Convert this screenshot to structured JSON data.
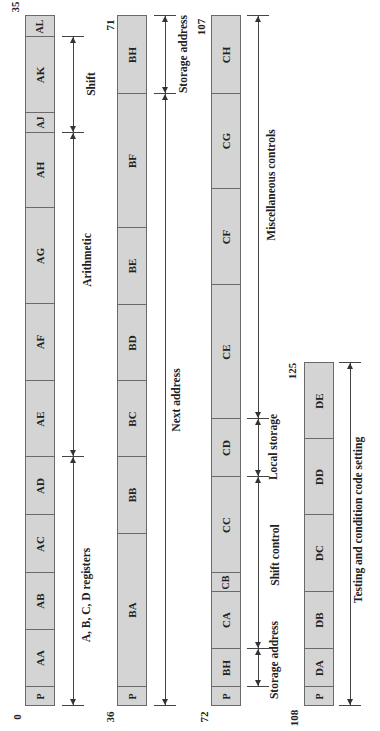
{
  "words": [
    {
      "start_bit": "0",
      "end_bit": "35",
      "fields": [
        {
          "label": "P",
          "top": 686,
          "bottom": 705
        },
        {
          "label": "AA",
          "top": 629,
          "bottom": 686
        },
        {
          "label": "AB",
          "top": 572,
          "bottom": 629
        },
        {
          "label": "AC",
          "top": 514,
          "bottom": 572
        },
        {
          "label": "AD",
          "top": 456,
          "bottom": 514
        },
        {
          "label": "AE",
          "top": 380,
          "bottom": 456
        },
        {
          "label": "AF",
          "top": 303,
          "bottom": 380
        },
        {
          "label": "AG",
          "top": 207,
          "bottom": 303
        },
        {
          "label": "AH",
          "top": 132,
          "bottom": 207
        },
        {
          "label": "AJ",
          "top": 112,
          "bottom": 132
        },
        {
          "label": "AK",
          "top": 36,
          "bottom": 112
        },
        {
          "label": "AL",
          "top": 15,
          "bottom": 36
        }
      ],
      "dimensions": [
        {
          "label": "A, B, C, D registers",
          "top": 456,
          "bottom": 705
        },
        {
          "label": "Arithmetic",
          "top": 132,
          "bottom": 456
        },
        {
          "label": "Shift",
          "top": 36,
          "bottom": 132
        }
      ]
    },
    {
      "start_bit": "36",
      "end_bit": "71",
      "fields": [
        {
          "label": "P",
          "top": 686,
          "bottom": 705
        },
        {
          "label": "BA",
          "top": 533,
          "bottom": 686
        },
        {
          "label": "BB",
          "top": 456,
          "bottom": 533
        },
        {
          "label": "BC",
          "top": 380,
          "bottom": 456
        },
        {
          "label": "BD",
          "top": 304,
          "bottom": 380
        },
        {
          "label": "BE",
          "top": 227,
          "bottom": 304
        },
        {
          "label": "BF",
          "top": 93,
          "bottom": 227
        },
        {
          "label": "BH",
          "top": 15,
          "bottom": 93
        }
      ],
      "dimensions": [
        {
          "label": "Next address",
          "top": 93,
          "bottom": 705
        },
        {
          "label": "Storage address",
          "top": 15,
          "bottom": 93
        }
      ]
    },
    {
      "start_bit": "72",
      "end_bit": "107",
      "fields": [
        {
          "label": "P",
          "top": 686,
          "bottom": 705
        },
        {
          "label": "BH",
          "top": 648,
          "bottom": 686
        },
        {
          "label": "CA",
          "top": 591,
          "bottom": 648
        },
        {
          "label": "CB",
          "top": 572,
          "bottom": 591
        },
        {
          "label": "CC",
          "top": 476,
          "bottom": 572
        },
        {
          "label": "CD",
          "top": 418,
          "bottom": 476
        },
        {
          "label": "CE",
          "top": 284,
          "bottom": 418
        },
        {
          "label": "CF",
          "top": 188,
          "bottom": 284
        },
        {
          "label": "CG",
          "top": 93,
          "bottom": 188
        },
        {
          "label": "CH",
          "top": 15,
          "bottom": 93
        }
      ],
      "dimensions": [
        {
          "label": "Storage address",
          "top": 648,
          "bottom": 686
        },
        {
          "label": "Shift control",
          "top": 476,
          "bottom": 648
        },
        {
          "label": "Local storage",
          "top": 418,
          "bottom": 476
        },
        {
          "label": "Miscellaneous controls",
          "top": 15,
          "bottom": 418
        }
      ]
    },
    {
      "start_bit": "108",
      "end_bit": "125",
      "fields": [
        {
          "label": "P",
          "top": 686,
          "bottom": 705
        },
        {
          "label": "DA",
          "top": 648,
          "bottom": 686
        },
        {
          "label": "DB",
          "top": 591,
          "bottom": 648
        },
        {
          "label": "DC",
          "top": 514,
          "bottom": 591
        },
        {
          "label": "DD",
          "top": 438,
          "bottom": 514
        },
        {
          "label": "DE",
          "top": 362,
          "bottom": 438
        }
      ],
      "dimensions": [
        {
          "label": "Testing and condition code setting",
          "top": 362,
          "bottom": 705
        }
      ]
    }
  ]
}
